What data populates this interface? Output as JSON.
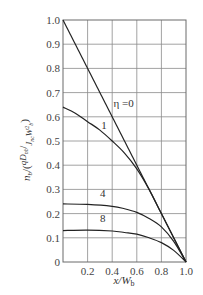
{
  "chart_data": {
    "type": "line",
    "title": "",
    "xlabel": "x/W_b",
    "ylabel": "n_b/(qD_nb/(J_nc W_b^2))",
    "xlim": [
      0,
      1.0
    ],
    "ylim": [
      0,
      1.0
    ],
    "grid": true,
    "x_ticks": [
      "0.2",
      "0.4",
      "0.6",
      "0.8",
      "1.0"
    ],
    "y_ticks": [
      "0",
      "0.1",
      "0.2",
      "0.3",
      "0.4",
      "0.5",
      "0.6",
      "0.7",
      "0.8",
      "0.9",
      "1.0"
    ],
    "x_tick_values": [
      0.2,
      0.4,
      0.6,
      0.8,
      1.0
    ],
    "y_tick_values": [
      0,
      0.1,
      0.2,
      0.3,
      0.4,
      0.5,
      0.6,
      0.7,
      0.8,
      0.9,
      1.0
    ],
    "legend": "inline curve labels",
    "series": [
      {
        "name": "η =0",
        "label": "η =0",
        "x": [
          0,
          1.0
        ],
        "y": [
          1.0,
          0
        ]
      },
      {
        "name": "η = 1",
        "label": "1",
        "x": [
          0,
          0.1,
          0.2,
          0.3,
          0.4,
          0.5,
          0.6,
          0.7,
          0.8,
          0.9,
          1.0
        ],
        "y": [
          0.64,
          0.615,
          0.58,
          0.545,
          0.5,
          0.45,
          0.385,
          0.3,
          0.2,
          0.1,
          0
        ]
      },
      {
        "name": "η = 4",
        "label": "4",
        "x": [
          0,
          0.2,
          0.4,
          0.5,
          0.6,
          0.7,
          0.8,
          0.9,
          1.0
        ],
        "y": [
          0.24,
          0.238,
          0.23,
          0.22,
          0.205,
          0.18,
          0.145,
          0.085,
          0
        ]
      },
      {
        "name": "η = 8",
        "label": "8",
        "x": [
          0,
          0.2,
          0.4,
          0.5,
          0.6,
          0.7,
          0.8,
          0.9,
          1.0
        ],
        "y": [
          0.13,
          0.132,
          0.128,
          0.122,
          0.115,
          0.1,
          0.08,
          0.048,
          0
        ]
      }
    ],
    "annotations": [
      {
        "text": "η =0",
        "x": 0.41,
        "y": 0.64
      },
      {
        "text": "1",
        "x": 0.31,
        "y": 0.55
      },
      {
        "text": "4",
        "x": 0.3,
        "y": 0.27
      },
      {
        "text": "8",
        "x": 0.3,
        "y": 0.165
      }
    ]
  },
  "colors": {
    "grid": "#8a8a8a",
    "curve": "#222222",
    "text": "#444444"
  }
}
